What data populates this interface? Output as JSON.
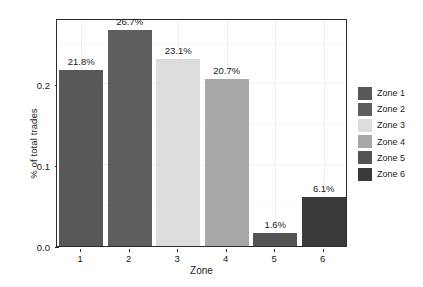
{
  "chart_data": {
    "type": "bar",
    "title": "",
    "xlabel": "Zone",
    "ylabel": "% of total trades",
    "categories": [
      "1",
      "2",
      "3",
      "4",
      "5",
      "6"
    ],
    "values": [
      0.218,
      0.267,
      0.231,
      0.207,
      0.016,
      0.061
    ],
    "data_labels": [
      "21.8%",
      "26.7%",
      "23.1%",
      "20.7%",
      "1.6%",
      "6.1%"
    ],
    "ylim": [
      0.0,
      0.2818
    ],
    "ytick_labels": [
      "0.0",
      "0.1",
      "0.2"
    ],
    "ytick_values": [
      0.0,
      0.1,
      0.2
    ],
    "grid": true,
    "legend_position": "right",
    "series_colors": [
      "#585858",
      "#5e5e5e",
      "#dcdcdc",
      "#a8a8a8",
      "#545454",
      "#3a3a3a"
    ],
    "legend": [
      {
        "label": "Zone 1",
        "color": "#585858"
      },
      {
        "label": "Zone 2",
        "color": "#5e5e5e"
      },
      {
        "label": "Zone 3",
        "color": "#dcdcdc"
      },
      {
        "label": "Zone 4",
        "color": "#a8a8a8"
      },
      {
        "label": "Zone 5",
        "color": "#545454"
      },
      {
        "label": "Zone 6",
        "color": "#3a3a3a"
      }
    ],
    "frame_color": "#2b2b2b",
    "grid_color": "#f0f0f0",
    "background": "#ffffff"
  }
}
